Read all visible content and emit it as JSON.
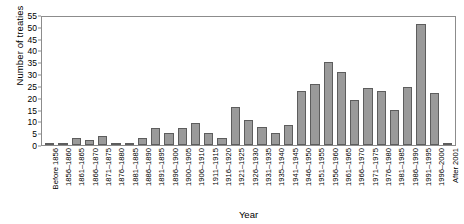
{
  "chart_data": {
    "type": "bar",
    "title": "",
    "xlabel": "Year",
    "ylabel": "Number of treaties",
    "ylim": [
      0,
      55
    ],
    "ytick_step": 5,
    "yticks": [
      0,
      5,
      10,
      15,
      20,
      25,
      30,
      35,
      40,
      45,
      50,
      55
    ],
    "grid": false,
    "legend": null,
    "bar_color": "#9a9a9a",
    "bar_edge_color": "#5d5d5d",
    "categories": [
      "Before 1856",
      "1856–1860",
      "1861–1865",
      "1866–1870",
      "1871–1875",
      "1876–1880",
      "1881–1885",
      "1886–1890",
      "1891–1895",
      "1896–1900",
      "1900–1905",
      "1906–1910",
      "1911–1915",
      "1916–1920",
      "1921–1925",
      "1926–1930",
      "1931–1935",
      "1935–1940",
      "1941–1945",
      "1946–1950",
      "1951–1955",
      "1956–1960",
      "1961–1965",
      "1966–1970",
      "1971–1975",
      "1976–1980",
      "1981–1985",
      "1986–1990",
      "1991–1995",
      "1996–2000",
      "After 2001"
    ],
    "values": [
      1,
      1,
      3,
      2,
      4,
      1,
      1,
      3,
      7,
      5,
      7,
      9.5,
      5,
      3,
      16,
      10.5,
      7.5,
      5,
      8.5,
      23,
      26,
      35,
      31,
      19,
      24,
      23,
      15,
      24.5,
      51,
      22,
      1
    ]
  }
}
